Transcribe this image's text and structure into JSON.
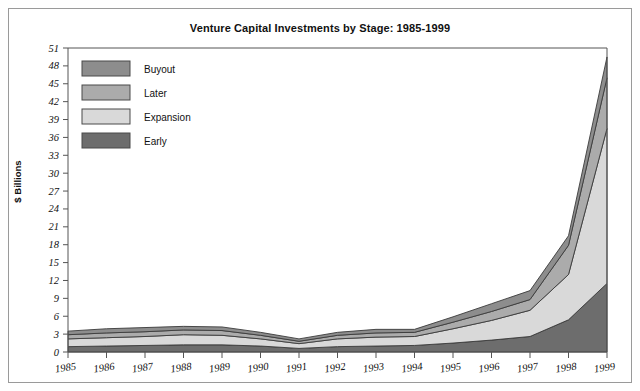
{
  "figure": {
    "title": "Venture Capital Investments by Stage: 1985-1999",
    "ylabel": "$ Billions"
  },
  "legend": {
    "position": "top-left-inside",
    "entries": [
      {
        "label": "Buyout",
        "color": "#8d8d8d"
      },
      {
        "label": "Later",
        "color": "#ababab"
      },
      {
        "label": "Expansion",
        "color": "#d9d9d9"
      },
      {
        "label": "Early",
        "color": "#6d6d6d"
      }
    ]
  },
  "axes": {
    "y_ticks": [
      "0",
      "3",
      "6",
      "9",
      "12",
      "15",
      "18",
      "21",
      "24",
      "27",
      "30",
      "33",
      "36",
      "39",
      "42",
      "45",
      "48",
      "51"
    ],
    "x_ticks": [
      "1985",
      "1986",
      "1987",
      "1988",
      "1989",
      "1990",
      "1991",
      "1992",
      "1993",
      "1994",
      "1995",
      "1996",
      "1997",
      "1998",
      "1999"
    ]
  },
  "chart_data": {
    "type": "area",
    "title": "Venture Capital Investments by Stage: 1985-1999",
    "xlabel": "",
    "ylabel": "$ Billions",
    "stacked": true,
    "grid": false,
    "legend_position": "upper left",
    "ylim": [
      0,
      51
    ],
    "ytick_step": 3,
    "categories": [
      "1985",
      "1986",
      "1987",
      "1988",
      "1989",
      "1990",
      "1991",
      "1992",
      "1993",
      "1994",
      "1995",
      "1996",
      "1997",
      "1998",
      "1999"
    ],
    "series": [
      {
        "name": "Early",
        "color": "#6d6d6d",
        "values": [
          0.9,
          1.0,
          1.1,
          1.2,
          1.2,
          1.0,
          0.6,
          0.9,
          1.0,
          1.1,
          1.5,
          2.0,
          2.6,
          5.4,
          11.5
        ]
      },
      {
        "name": "Expansion",
        "color": "#d9d9d9",
        "values": [
          1.3,
          1.4,
          1.5,
          1.7,
          1.6,
          1.2,
          0.8,
          1.3,
          1.5,
          1.5,
          2.4,
          3.3,
          4.4,
          7.6,
          26.0
        ]
      },
      {
        "name": "Later",
        "color": "#ababab",
        "values": [
          0.7,
          0.8,
          0.8,
          0.8,
          0.8,
          0.6,
          0.4,
          0.6,
          0.7,
          0.7,
          1.1,
          1.5,
          1.8,
          4.9,
          8.5
        ]
      },
      {
        "name": "Buyout",
        "color": "#8d8d8d",
        "values": [
          0.6,
          0.7,
          0.7,
          0.6,
          0.6,
          0.5,
          0.4,
          0.5,
          0.6,
          0.5,
          0.9,
          1.3,
          1.5,
          1.6,
          3.5
        ]
      }
    ],
    "totals": [
      3.5,
      3.9,
      4.1,
      4.3,
      4.2,
      3.3,
      2.2,
      3.3,
      3.8,
      3.8,
      5.9,
      8.1,
      10.3,
      19.5,
      49.5
    ]
  }
}
